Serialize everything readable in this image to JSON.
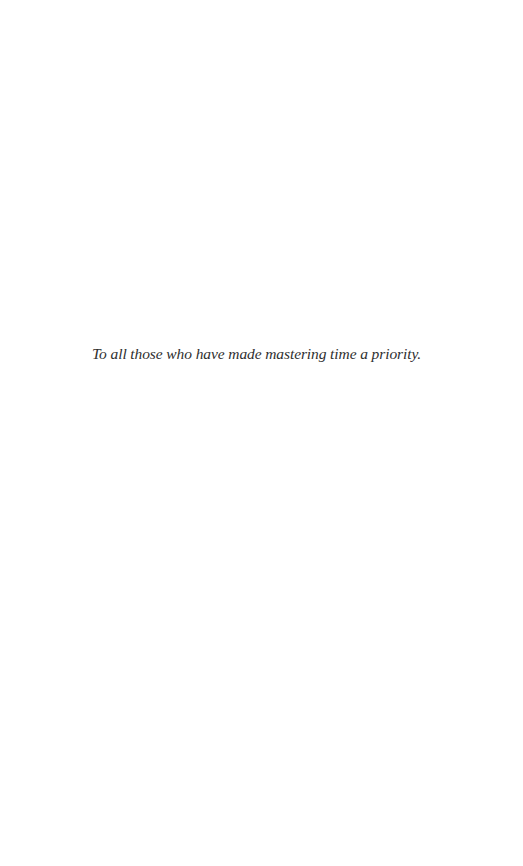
{
  "page": {
    "background": "#ffffff",
    "text_color": "#2f2f2f"
  },
  "dedication": {
    "text": "To all those who have made mastering time a priority."
  }
}
